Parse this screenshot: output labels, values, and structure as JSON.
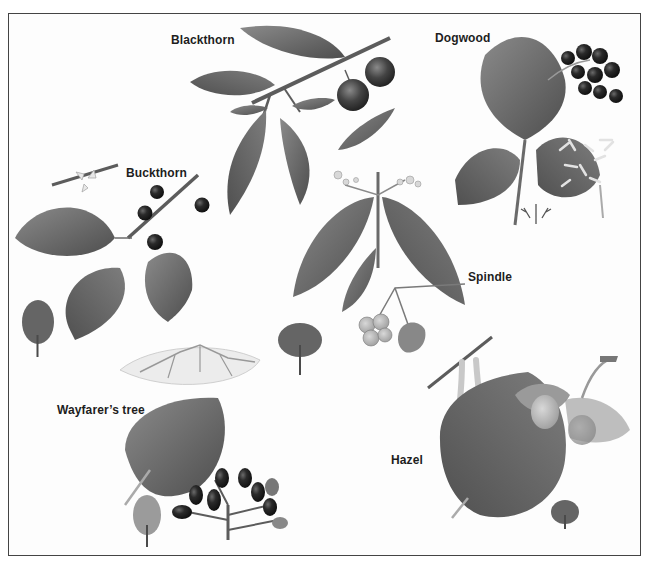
{
  "plate": {
    "description": "Botanical illustration plate of hedgerow shrubs",
    "style": "grayscale painted illustration",
    "colors": {
      "border": "#444444",
      "background": "#fdfdfd",
      "leaf_dark": "#5a5a5a",
      "leaf_mid": "#7a7a7a",
      "berry": "#1c1c1c",
      "label": "#1e1e1e"
    }
  },
  "species": [
    {
      "id": "blackthorn",
      "label": "Blackthorn",
      "depicts": [
        "branch with leaves",
        "two sloe fruits"
      ]
    },
    {
      "id": "dogwood",
      "label": "Dogwood",
      "depicts": [
        "leaves",
        "black berry cluster",
        "white flower cluster",
        "tree silhouette"
      ]
    },
    {
      "id": "buckthorn",
      "label": "Buckthorn",
      "depicts": [
        "twig with flowers",
        "branch with leaves",
        "black berries",
        "tree silhouette"
      ]
    },
    {
      "id": "spindle",
      "label": "Spindle",
      "depicts": [
        "paired leaves",
        "small flowers",
        "lobed fruits"
      ]
    },
    {
      "id": "wayfarers-tree",
      "label": "Wayfarer’s tree",
      "depicts": [
        "flower cluster",
        "broad leaf",
        "berry cluster",
        "tree silhouette"
      ]
    },
    {
      "id": "hazel",
      "label": "Hazel",
      "depicts": [
        "twig with catkins",
        "toothed leaf",
        "nut cluster",
        "tree silhouette"
      ]
    }
  ]
}
